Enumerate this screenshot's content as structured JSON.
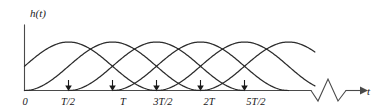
{
  "figure": {
    "type": "waveform-diagram",
    "stroke_color": "#2b2b2b",
    "background_color": "#ffffff",
    "axis_color": "#4a4a4a"
  },
  "axes": {
    "y_label": "h(t)",
    "x_label": "t",
    "origin_label": "0",
    "x_axis_has_break": true,
    "x_axis_arrow": true
  },
  "ticks": [
    {
      "label": "0",
      "value": 0.0
    },
    {
      "label": "T/2",
      "value": 0.5
    },
    {
      "label": "T",
      "value": 1.0
    },
    {
      "label": "3T/2",
      "value": 1.5
    },
    {
      "label": "2T",
      "value": 2.0
    },
    {
      "label": "5T/2",
      "value": 2.5
    }
  ],
  "chart_data": {
    "type": "line",
    "title": "",
    "xlabel": "t",
    "ylabel": "h(t)",
    "xlim": [
      0,
      3.3
    ],
    "ylim": [
      0,
      1.1
    ],
    "grid": false,
    "legend": null,
    "tick_labels_x": [
      "0",
      "T/2",
      "T",
      "3T/2",
      "2T",
      "5T/2"
    ],
    "tick_values_x": [
      0,
      0.5,
      1.0,
      1.5,
      2.0,
      2.5
    ],
    "pulse_shape": "raised-cosine",
    "pulse_formula": "0.5*(1 - cos(pi*(t - t0)/T))  for  t0 <= t <= t0 + 2T",
    "pulse_width_in_T": 2.0,
    "pulse_spacing_in_T": 1.0,
    "pulse_peak_amplitude": 1.0,
    "crossing_amplitude": 0.5,
    "series": [
      {
        "name": "pulse-1",
        "center_t": 0.5,
        "start_t": -0.5,
        "end_t": 1.5
      },
      {
        "name": "pulse-2",
        "center_t": 1.5,
        "start_t": 0.5,
        "end_t": 2.5
      },
      {
        "name": "pulse-3",
        "center_t": 2.5,
        "start_t": 1.5,
        "end_t": 3.5
      },
      {
        "name": "pulse-4",
        "center_t": 1.0,
        "start_t": 0.0,
        "end_t": 2.0
      },
      {
        "name": "pulse-5",
        "center_t": 2.0,
        "start_t": 1.0,
        "end_t": 3.0
      },
      {
        "name": "pulse-6",
        "center_t": 3.0,
        "start_t": 2.0,
        "end_t": 4.0
      }
    ]
  }
}
